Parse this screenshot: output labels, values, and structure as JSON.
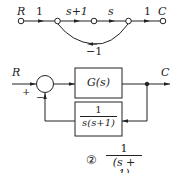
{
  "signal_flow_graph": {
    "node_labels": {
      "start": "R",
      "end": "C"
    },
    "branch_gains": [
      "1",
      "s+1",
      "s",
      "1"
    ],
    "feedback_gain": "−1"
  },
  "block_diagram": {
    "input": "R",
    "output": "C",
    "sum_signs": {
      "plus": "+",
      "minus": "−"
    },
    "forward_block": "G(s)",
    "feedback_block": {
      "numerator": "1",
      "denominator": "s(s+1)"
    }
  },
  "answer": {
    "marker": "②",
    "numerator": "1",
    "denominator": "(s + 1)"
  }
}
